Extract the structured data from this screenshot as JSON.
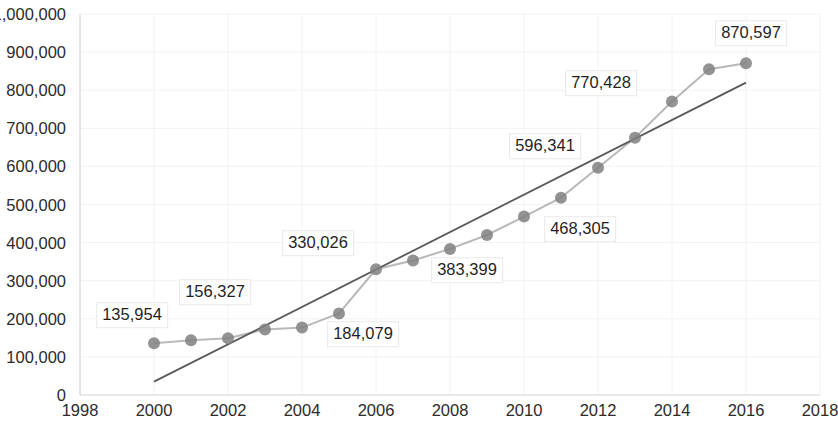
{
  "chart_data": {
    "type": "line",
    "title": "",
    "xlabel": "",
    "ylabel": "",
    "xlim": [
      1998,
      2018
    ],
    "ylim": [
      0,
      1000000
    ],
    "grid": true,
    "legend": "none",
    "x_ticks": [
      "1998",
      "2000",
      "2002",
      "2004",
      "2006",
      "2008",
      "2010",
      "2012",
      "2014",
      "2016",
      "2018"
    ],
    "x_tick_values": [
      1998,
      2000,
      2002,
      2004,
      2006,
      2008,
      2010,
      2012,
      2014,
      2016,
      2018
    ],
    "y_ticks": [
      "0",
      "100,000",
      "200,000",
      "300,000",
      "400,000",
      "500,000",
      "600,000",
      "700,000",
      "800,000",
      "900,000",
      "1,000,000"
    ],
    "y_tick_values": [
      0,
      100000,
      200000,
      300000,
      400000,
      500000,
      600000,
      700000,
      800000,
      900000,
      1000000
    ],
    "x": [
      2000,
      2001,
      2002,
      2003,
      2004,
      2005,
      2006,
      2007,
      2008,
      2009,
      2010,
      2011,
      2012,
      2013,
      2014,
      2015,
      2016
    ],
    "series": [
      {
        "name": "Series 1",
        "color": "#808080",
        "marker": "circle",
        "values": [
          135954,
          144000,
          149000,
          172000,
          177000,
          214000,
          330026,
          353000,
          383399,
          420000,
          468305,
          518000,
          596341,
          675000,
          770428,
          855000,
          870597
        ]
      }
    ],
    "trendline": {
      "name": "Linear trendline",
      "color": "#595959",
      "x_start": 2000,
      "y_start": 35000,
      "x_end": 2016,
      "y_end": 820000
    },
    "data_labels": [
      {
        "text": "135,954",
        "x_value": 2000,
        "y_value": 135954,
        "px": 132,
        "py": 315
      },
      {
        "text": "156,327",
        "x_value": 2002,
        "y_value": 156327,
        "px": 215,
        "py": 292
      },
      {
        "text": "184,079",
        "x_value": 2005,
        "y_value": 184079,
        "px": 363,
        "py": 334
      },
      {
        "text": "330,026",
        "x_value": 2006,
        "y_value": 330026,
        "px": 318,
        "py": 243
      },
      {
        "text": "383,399",
        "x_value": 2009,
        "y_value": 383399,
        "px": 467,
        "py": 270
      },
      {
        "text": "468,305",
        "x_value": 2011,
        "y_value": 468305,
        "px": 580,
        "py": 229
      },
      {
        "text": "596,341",
        "x_value": 2012,
        "y_value": 596341,
        "px": 545,
        "py": 146
      },
      {
        "text": "770,428",
        "x_value": 2014,
        "y_value": 770428,
        "px": 601,
        "py": 83
      },
      {
        "text": "870,597",
        "x_value": 2016,
        "y_value": 870597,
        "px": 751,
        "py": 33
      }
    ]
  }
}
